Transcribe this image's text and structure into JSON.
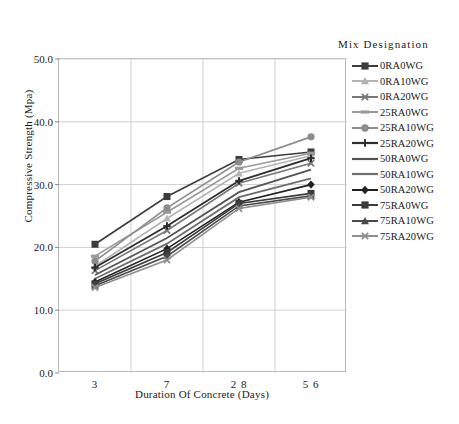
{
  "chart_data": {
    "type": "line",
    "title": "",
    "xlabel": "Duration Of Concrete (Days)",
    "ylabel": "Compressive Strength (Mpa)",
    "categories": [
      "3",
      "7",
      "28",
      "56"
    ],
    "x_tick_labels": [
      "3",
      "7",
      "2 8",
      "5 6"
    ],
    "y_tick_labels": [
      "0.0",
      "10.0",
      "20.0",
      "30.0",
      "40.0",
      "50.0"
    ],
    "y_ticks": [
      0,
      10,
      20,
      30,
      40,
      50
    ],
    "ylim": [
      0,
      50
    ],
    "grid": true,
    "legend_position": "right",
    "legend_title": "Mix Designation",
    "series": [
      {
        "name": "0RA0WG",
        "values": [
          20.5,
          28.1,
          34.0,
          35.2
        ],
        "color": "#3c3c3c",
        "marker": "square",
        "width": 1.6
      },
      {
        "name": "0RA10WG",
        "values": [
          17.0,
          24.6,
          31.8,
          34.6
        ],
        "color": "#b4b4b4",
        "marker": "triangle",
        "width": 1.6
      },
      {
        "name": "0RA20WG",
        "values": [
          16.3,
          22.7,
          30.2,
          33.4
        ],
        "color": "#787878",
        "marker": "cross",
        "width": 1.6
      },
      {
        "name": "25RA0WG",
        "values": [
          18.6,
          25.6,
          32.6,
          35.0
        ],
        "color": "#9a9a9a",
        "marker": "dash",
        "width": 1.6
      },
      {
        "name": "25RA10WG",
        "values": [
          17.8,
          26.3,
          33.6,
          37.6
        ],
        "color": "#8c8c8c",
        "marker": "circle",
        "width": 1.6
      },
      {
        "name": "25RA20WG",
        "values": [
          16.8,
          23.4,
          30.6,
          34.2
        ],
        "color": "#2e2e2e",
        "marker": "plus",
        "width": 1.8
      },
      {
        "name": "50RA0WG",
        "values": [
          15.6,
          21.5,
          28.8,
          32.4
        ],
        "color": "#555555",
        "marker": "none",
        "width": 1.8
      },
      {
        "name": "50RA10WG",
        "values": [
          15.0,
          20.6,
          28.0,
          31.0
        ],
        "color": "#6e6e6e",
        "marker": "none",
        "width": 1.8
      },
      {
        "name": "50RA20WG",
        "values": [
          14.5,
          19.8,
          27.2,
          30.0
        ],
        "color": "#202020",
        "marker": "diamond",
        "width": 1.6
      },
      {
        "name": "75RA0WG",
        "values": [
          14.2,
          19.2,
          27.0,
          28.6
        ],
        "color": "#3a3a3a",
        "marker": "square",
        "width": 1.6
      },
      {
        "name": "75RA10WG",
        "values": [
          13.9,
          18.6,
          26.6,
          28.2
        ],
        "color": "#4a4a4a",
        "marker": "triangle",
        "width": 1.6
      },
      {
        "name": "75RA20WG",
        "values": [
          13.6,
          18.0,
          26.2,
          28.0
        ],
        "color": "#8f8f8f",
        "marker": "cross",
        "width": 1.6
      }
    ]
  },
  "legend": {
    "title": "Mix Designation"
  }
}
